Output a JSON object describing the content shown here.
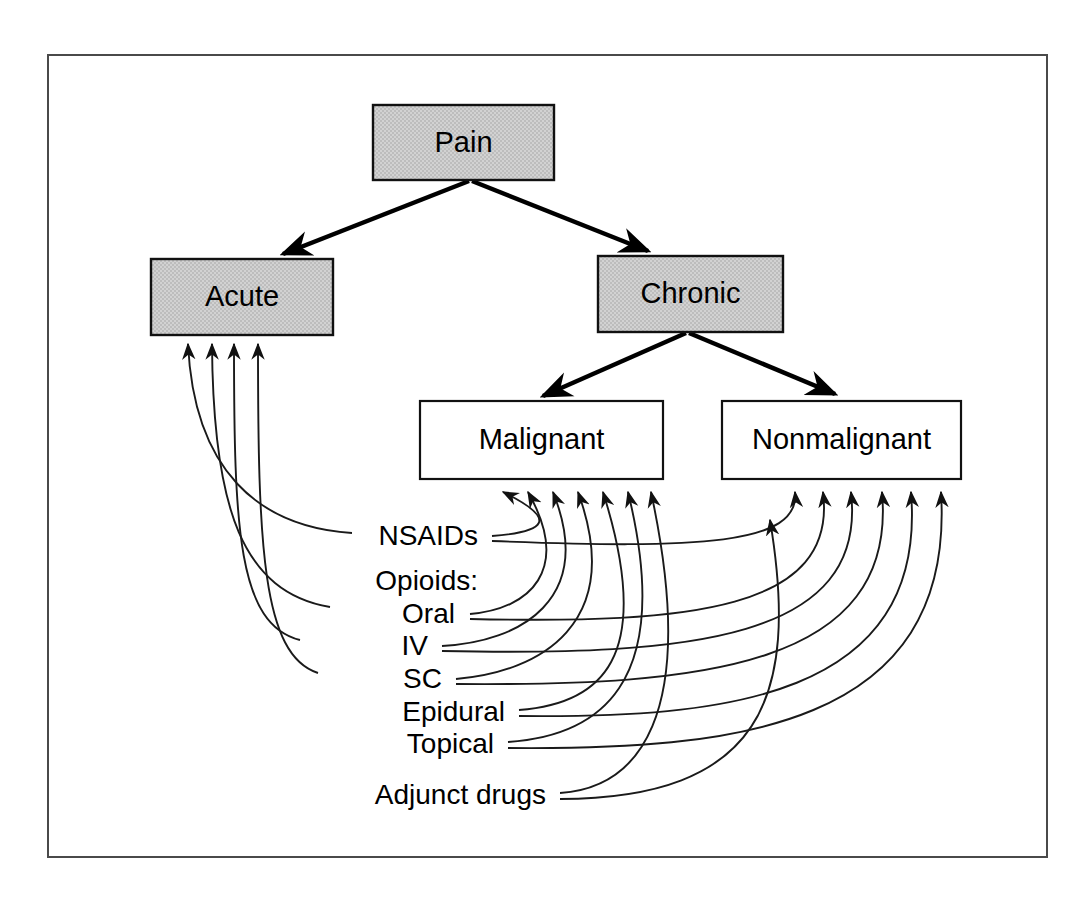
{
  "figure": {
    "kind": "flowchart",
    "title_visible": false,
    "frame": {
      "x": 48,
      "y": 55,
      "width": 999,
      "height": 802,
      "stroke": "#4a4a4a"
    }
  },
  "colors": {
    "shaded_fill": "#c9c9c9",
    "plain_fill": "#ffffff",
    "stroke": "#111111",
    "frame_stroke": "#4a4a4a",
    "background": "#ffffff"
  },
  "nodes": [
    {
      "id": "pain",
      "label": "Pain",
      "shaded": true,
      "x": 373,
      "y": 105,
      "w": 181,
      "h": 75
    },
    {
      "id": "acute",
      "label": "Acute",
      "shaded": true,
      "x": 151,
      "y": 259,
      "w": 182,
      "h": 76
    },
    {
      "id": "chronic",
      "label": "Chronic",
      "shaded": true,
      "x": 598,
      "y": 256,
      "w": 185,
      "h": 76
    },
    {
      "id": "malignant",
      "label": "Malignant",
      "shaded": false,
      "x": 420,
      "y": 401,
      "w": 243,
      "h": 78
    },
    {
      "id": "nonmalignant",
      "label": "Nonmalignant",
      "shaded": false,
      "x": 722,
      "y": 401,
      "w": 239,
      "h": 78
    }
  ],
  "tree_edges": [
    {
      "from": "pain",
      "to": "acute",
      "label": ""
    },
    {
      "from": "pain",
      "to": "chronic",
      "label": ""
    },
    {
      "from": "chronic",
      "to": "malignant",
      "label": ""
    },
    {
      "from": "chronic",
      "to": "nonmalignant",
      "label": ""
    }
  ],
  "treatments": [
    {
      "id": "nsaids",
      "label": "NSAIDs",
      "y": 538,
      "text_x": 478,
      "targets": [
        "acute",
        "malignant",
        "nonmalignant"
      ]
    },
    {
      "id": "opioids",
      "label": "Opioids:",
      "y": 583,
      "text_x": 478,
      "targets": []
    },
    {
      "id": "oral",
      "label": "Oral",
      "y": 616,
      "text_x": 455,
      "targets": [
        "acute",
        "malignant",
        "nonmalignant"
      ]
    },
    {
      "id": "iv",
      "label": "IV",
      "y": 648,
      "text_x": 428,
      "targets": [
        "acute",
        "malignant",
        "nonmalignant"
      ]
    },
    {
      "id": "sc",
      "label": "SC",
      "y": 681,
      "text_x": 442,
      "targets": [
        "acute",
        "malignant",
        "nonmalignant"
      ]
    },
    {
      "id": "epidural",
      "label": "Epidural",
      "y": 714,
      "text_x": 505,
      "targets": [
        "malignant",
        "nonmalignant"
      ]
    },
    {
      "id": "topical",
      "label": "Topical",
      "y": 746,
      "text_x": 494,
      "targets": [
        "malignant",
        "nonmalignant"
      ]
    },
    {
      "id": "adjunct",
      "label": "Adjunct drugs",
      "y": 797,
      "text_x": 546,
      "targets": [
        "malignant",
        "nonmalignant"
      ]
    }
  ],
  "arrow_counts": {
    "into_acute": 4,
    "into_malignant": 7,
    "into_nonmalignant": 6
  },
  "arrow_entry_points": {
    "acute": [
      188,
      212,
      234,
      258
    ],
    "malignant": [
      503,
      528,
      553,
      578,
      603,
      628,
      651
    ],
    "nonmalignant": [
      795,
      823,
      851,
      882,
      911,
      941
    ]
  }
}
